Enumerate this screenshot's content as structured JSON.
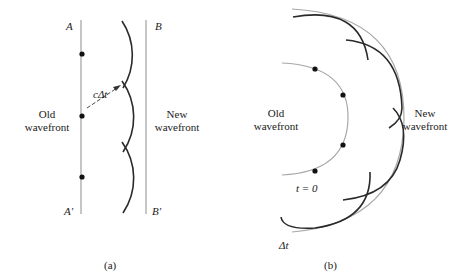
{
  "panel_a": {
    "caption": "(a)",
    "label_A": "A",
    "label_B": "B",
    "label_A_prime": "A′",
    "label_B_prime": "B′",
    "distance_label": "cΔt",
    "old_wavefront": {
      "line1": "Old",
      "line2": "wavefront"
    },
    "new_wavefront": {
      "line1": "New",
      "line2": "wavefront"
    }
  },
  "panel_b": {
    "caption": "(b)",
    "time_start_label": "t = 0",
    "time_elapsed_label": "Δt",
    "old_wavefront": {
      "line1": "Old",
      "line2": "wavefront"
    },
    "new_wavefront": {
      "line1": "New",
      "line2": "wavefront"
    }
  },
  "colors": {
    "wavefront_line": "#a8a8a8",
    "wavelet_arc": "#2a2a2a",
    "source_point": "#111111"
  }
}
